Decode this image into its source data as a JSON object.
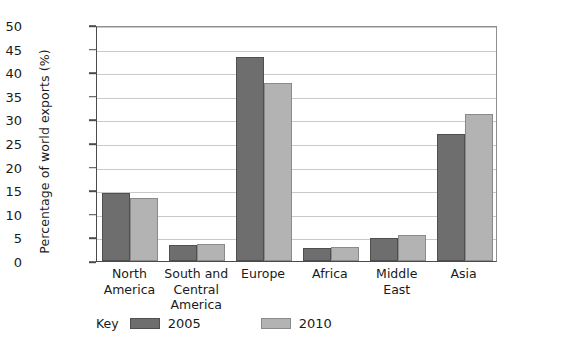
{
  "chart_data": {
    "type": "bar",
    "title": "",
    "xlabel": "",
    "ylabel": "Percentage of world exports (%)",
    "ylim": [
      0,
      50
    ],
    "ytick_step": 5,
    "yticks": [
      50,
      45,
      40,
      35,
      30,
      25,
      20,
      15,
      10,
      5,
      0
    ],
    "grid": true,
    "legend_position": "bottom",
    "legend_title": "Key",
    "categories": [
      "North America",
      "South and Central America",
      "Europe",
      "Africa",
      "Middle East",
      "Asia"
    ],
    "category_lines": [
      [
        "North",
        "America"
      ],
      [
        "South and",
        "Central",
        "America"
      ],
      [
        "Europe"
      ],
      [
        "Africa"
      ],
      [
        "Middle",
        "East"
      ],
      [
        "Asia"
      ]
    ],
    "series": [
      {
        "name": "2005",
        "color": "#6e6e6e",
        "values": [
          14.5,
          3.4,
          43.3,
          2.8,
          4.8,
          27.0
        ]
      },
      {
        "name": "2010",
        "color": "#b3b3b3",
        "values": [
          13.3,
          3.6,
          37.8,
          3.0,
          5.5,
          31.2
        ]
      }
    ]
  },
  "colors": {
    "series_2005": "#6e6e6e",
    "series_2010": "#b3b3b3",
    "gridline": "#c9c9c9",
    "axis": "#4a4a4a",
    "background": "#ffffff"
  }
}
